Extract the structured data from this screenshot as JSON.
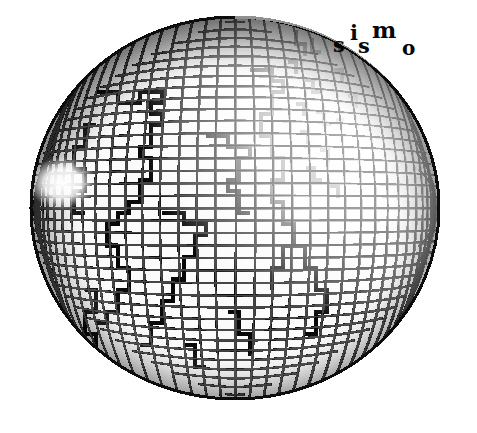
{
  "image": {
    "kind": "logo-illustration",
    "subject": "wireframe globe with latitude-longitude mesh and continental coastlines",
    "width": 477,
    "height": 433,
    "background_color": "#ffffff",
    "ink_color": "#0a0a0a"
  },
  "wordmark": {
    "text": "sismo",
    "style": "bold serif, letters on a wavy/arched baseline",
    "color": "#050505",
    "letters": [
      {
        "char": "s",
        "name": "wordmark-letter-s1"
      },
      {
        "char": "i",
        "name": "wordmark-letter-i"
      },
      {
        "char": "s",
        "name": "wordmark-letter-s2"
      },
      {
        "char": "m",
        "name": "wordmark-letter-m"
      },
      {
        "char": "o",
        "name": "wordmark-letter-o"
      }
    ]
  },
  "globe": {
    "center_x": 235,
    "center_y": 208,
    "radius_x": 205,
    "radius_y": 192,
    "mesh": {
      "type": "quadrilateral-grid",
      "cell_size_px": 11,
      "line_color": "#101010",
      "description": "dense projected graticule of meridians and parallels, darkest toward the limb, fading to white in the upper-right quadrant"
    },
    "features": [
      {
        "name": "coastline-overlay",
        "description": "continental outlines drawn as thick stepped polylines over the mesh"
      },
      {
        "name": "upper-right-fade",
        "description": "grid fades out / drops to white toward the north-east limb"
      },
      {
        "name": "left-limb-notch",
        "description": "white gap interrupting the mesh on the western limb"
      },
      {
        "name": "detached-coast-fragments",
        "description": "isolated dark coast fragments floating beyond the mesh near the top-right"
      }
    ]
  }
}
